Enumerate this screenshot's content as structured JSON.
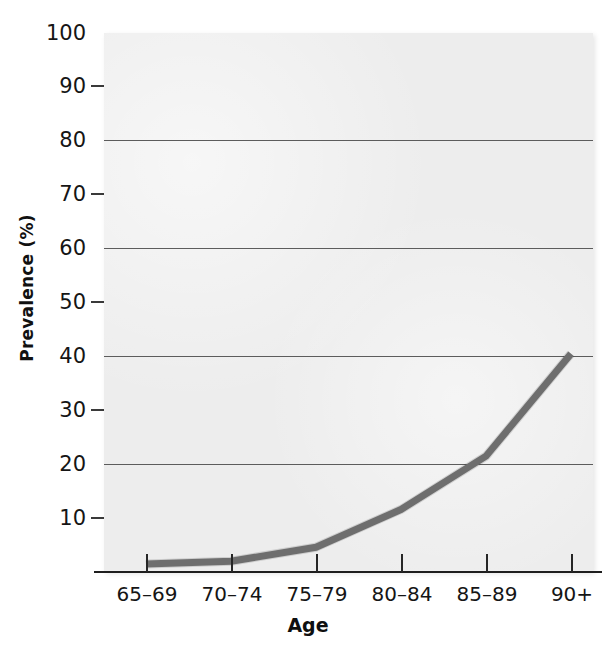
{
  "chart_data": {
    "type": "line",
    "title": "",
    "xlabel": "Age",
    "ylabel": "Prevalence (%)",
    "categories": [
      "65–69",
      "70–74",
      "75–79",
      "80–84",
      "85–89",
      "90+"
    ],
    "values": [
      1.5,
      2.0,
      4.6,
      11.6,
      21.5,
      40.5
    ],
    "series": [
      {
        "name": "Prevalence",
        "values": [
          1.5,
          2.0,
          4.6,
          11.6,
          21.5,
          40.5
        ],
        "color": "#6e6e6e"
      }
    ],
    "ylim": [
      0,
      100
    ],
    "ytick_labels": [
      "100",
      "90",
      "80",
      "70",
      "60",
      "50",
      "40",
      "30",
      "20",
      "10"
    ],
    "ytick_values": [
      100,
      90,
      80,
      70,
      60,
      50,
      40,
      30,
      20,
      10
    ],
    "gridline_values": [
      80,
      60,
      40,
      20
    ],
    "minor_tick_values": [
      90,
      70,
      50,
      30,
      10
    ],
    "grid": true,
    "legend": "none",
    "plot_background": "#ededed",
    "line_color": "#6e6e6e",
    "axis_color": "#1e1e1e",
    "gridline_color": "#5c5c5c"
  }
}
